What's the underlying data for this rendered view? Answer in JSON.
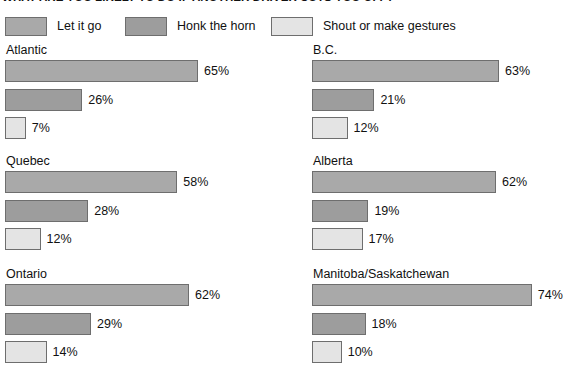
{
  "chart_data": {
    "type": "bar",
    "orientation": "horizontal",
    "title": "WHAT ARE YOU LIKELY TO DO IF ANOTHER DRIVER CUTS YOU OFF?",
    "xlabel": "",
    "ylabel": "",
    "xlim": [
      0,
      100
    ],
    "grid": false,
    "legend_position": "top",
    "value_suffix": "%",
    "series_colors": [
      "#a9a9a9",
      "#9d9d9d",
      "#e4e4e4"
    ],
    "border_color": "#6e6e6e",
    "legend": [
      {
        "label": "Let it go",
        "color": "#a9a9a9"
      },
      {
        "label": "Honk the horn",
        "color": "#9d9d9d"
      },
      {
        "label": "Shout or make gestures",
        "color": "#e4e4e4"
      }
    ],
    "categories": [
      "Let it go",
      "Honk the horn",
      "Shout or make gestures"
    ],
    "panels": [
      {
        "name": "Atlantic",
        "values": [
          65,
          26,
          7
        ],
        "labels": [
          "65%",
          "26%",
          "7%"
        ]
      },
      {
        "name": "B.C.",
        "values": [
          63,
          21,
          12
        ],
        "labels": [
          "63%",
          "21%",
          "12%"
        ]
      },
      {
        "name": "Quebec",
        "values": [
          58,
          28,
          12
        ],
        "labels": [
          "58%",
          "28%",
          "12%"
        ]
      },
      {
        "name": "Alberta",
        "values": [
          62,
          19,
          17
        ],
        "labels": [
          "62%",
          "19%",
          "17%"
        ]
      },
      {
        "name": "Ontario",
        "values": [
          62,
          29,
          14
        ],
        "labels": [
          "62%",
          "29%",
          "14%"
        ]
      },
      {
        "name": "Manitoba/Saskatchewan",
        "values": [
          74,
          18,
          10
        ],
        "labels": [
          "74%",
          "18%",
          "10%"
        ]
      }
    ]
  }
}
